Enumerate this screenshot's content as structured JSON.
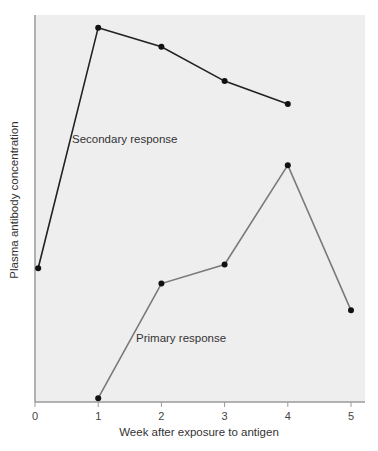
{
  "chart_data": {
    "type": "line",
    "title": "",
    "xlabel": "Week after exposure to antigen",
    "ylabel": "Plasma antibody concentration",
    "x_ticks": [
      0,
      1,
      2,
      3,
      4,
      5
    ],
    "xlim": [
      0,
      5.2
    ],
    "ylim": [
      0,
      100
    ],
    "y_ticks": [],
    "grid": false,
    "legend": null,
    "series": [
      {
        "name": "Secondary response",
        "color": "#222222",
        "x": [
          0.05,
          1,
          2,
          3,
          4
        ],
        "y": [
          35,
          98,
          93,
          84,
          78
        ]
      },
      {
        "name": "Primary response",
        "color": "#7a7a7a",
        "x": [
          1,
          2,
          3,
          4,
          5
        ],
        "y": [
          1,
          31,
          36,
          62,
          24
        ]
      }
    ],
    "annotations": [
      {
        "text": "Secondary response",
        "near_series": "Secondary response"
      },
      {
        "text": "Primary response",
        "near_series": "Primary response"
      }
    ]
  },
  "labels": {
    "xlabel": "Week after exposure to antigen",
    "ylabel": "Plasma antibody concentration",
    "secondary": "Secondary response",
    "primary": "Primary response"
  }
}
